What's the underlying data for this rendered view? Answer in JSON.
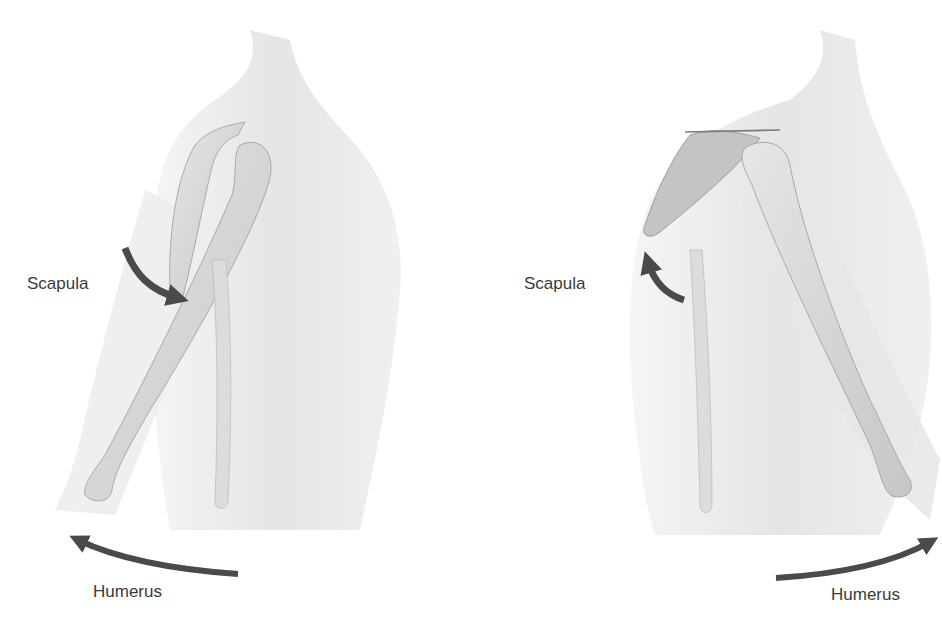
{
  "figure": {
    "panels": [
      {
        "id": "left",
        "description": "Shoulder with arm raised and extended forward",
        "labels": {
          "scapula": "Scapula",
          "humerus": "Humerus"
        },
        "arrows": {
          "scapula": "downward-rotation",
          "humerus": "leftward"
        }
      },
      {
        "id": "right",
        "description": "Shoulder with arm extended backward",
        "labels": {
          "scapula": "Scapula",
          "humerus": "Humerus"
        },
        "arrows": {
          "scapula": "upward-rotation",
          "humerus": "rightward"
        }
      }
    ],
    "colors": {
      "arrow": "#4a4a4a",
      "label_text": "#3a3a3a",
      "body_fill": "#e4e4e4",
      "bone_fill": "#d2d2d2"
    }
  }
}
